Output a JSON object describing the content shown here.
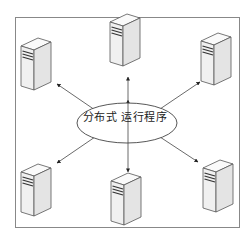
{
  "diagram": {
    "center_label": "分布式 运行程序",
    "center_label_parts": [
      "分布式",
      "运行程序"
    ],
    "nodes": [
      {
        "id": "server-top-left",
        "type": "server"
      },
      {
        "id": "server-top-center",
        "type": "server"
      },
      {
        "id": "server-top-right",
        "type": "server"
      },
      {
        "id": "server-bottom-left",
        "type": "server"
      },
      {
        "id": "server-bottom-center",
        "type": "server"
      },
      {
        "id": "server-bottom-right",
        "type": "server"
      }
    ],
    "edges": [
      {
        "from": "center",
        "to": "server-top-left",
        "directed": true
      },
      {
        "from": "center",
        "to": "server-top-center",
        "directed": true
      },
      {
        "from": "center",
        "to": "server-top-right",
        "directed": true
      },
      {
        "from": "center",
        "to": "server-bottom-left",
        "directed": true
      },
      {
        "from": "center",
        "to": "server-bottom-center",
        "directed": true
      },
      {
        "from": "center",
        "to": "server-bottom-right",
        "directed": true
      }
    ],
    "colors": {
      "border": "#888888",
      "line": "#444444",
      "server_front": "#f2f2f2",
      "server_side": "#e6e6e6",
      "server_top": "#fafafa",
      "server_outline": "#555555",
      "vent": "#333333"
    }
  }
}
